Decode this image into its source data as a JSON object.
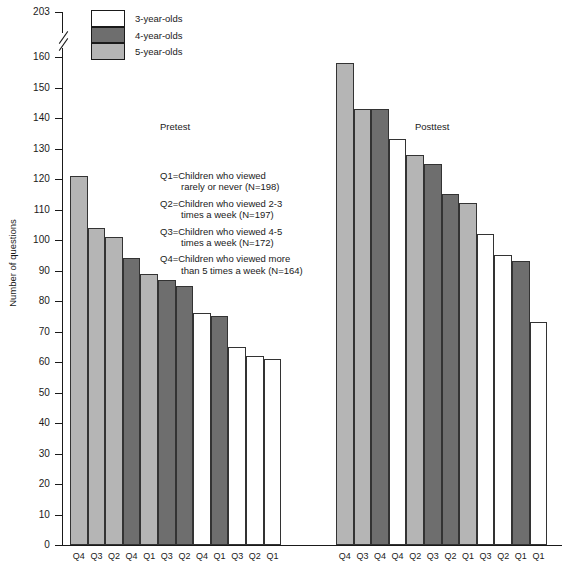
{
  "chart_data": {
    "type": "bar",
    "title": "",
    "xlabel": "",
    "ylabel": "Number of questions",
    "ylim": [
      0,
      203
    ],
    "yticks": [
      0,
      10,
      20,
      30,
      40,
      50,
      60,
      70,
      80,
      90,
      100,
      110,
      120,
      130,
      140,
      150,
      160,
      203
    ],
    "axis_break": {
      "after": 160,
      "before": 203
    },
    "grid": false,
    "legend_position": "top-left",
    "legend": [
      {
        "label": "3-year-olds",
        "color": "#ffffff"
      },
      {
        "label": "4-year-olds",
        "color": "#6e6e6e"
      },
      {
        "label": "5-year-olds",
        "color": "#b5b5b5"
      }
    ],
    "groups": [
      {
        "name": "Pretest",
        "bars": [
          {
            "category": "Q4",
            "series": "5-year-olds",
            "value": 121,
            "color": "#b5b5b5"
          },
          {
            "category": "Q3",
            "series": "5-year-olds",
            "value": 104,
            "color": "#b5b5b5"
          },
          {
            "category": "Q2",
            "series": "5-year-olds",
            "value": 101,
            "color": "#b5b5b5"
          },
          {
            "category": "Q4",
            "series": "4-year-olds",
            "value": 94,
            "color": "#6e6e6e"
          },
          {
            "category": "Q1",
            "series": "5-year-olds",
            "value": 89,
            "color": "#b5b5b5"
          },
          {
            "category": "Q3",
            "series": "4-year-olds",
            "value": 87,
            "color": "#6e6e6e"
          },
          {
            "category": "Q2",
            "series": "4-year-olds",
            "value": 85,
            "color": "#6e6e6e"
          },
          {
            "category": "Q4",
            "series": "3-year-olds",
            "value": 76,
            "color": "#ffffff"
          },
          {
            "category": "Q1",
            "series": "4-year-olds",
            "value": 75,
            "color": "#6e6e6e"
          },
          {
            "category": "Q3",
            "series": "3-year-olds",
            "value": 65,
            "color": "#ffffff"
          },
          {
            "category": "Q2",
            "series": "3-year-olds",
            "value": 62,
            "color": "#ffffff"
          },
          {
            "category": "Q1",
            "series": "3-year-olds",
            "value": 61,
            "color": "#ffffff"
          }
        ]
      },
      {
        "name": "Posttest",
        "bars": [
          {
            "category": "Q4",
            "series": "5-year-olds",
            "value": 158,
            "color": "#b5b5b5"
          },
          {
            "category": "Q3",
            "series": "5-year-olds",
            "value": 143,
            "color": "#b5b5b5"
          },
          {
            "category": "Q4",
            "series": "4-year-olds",
            "value": 143,
            "color": "#6e6e6e"
          },
          {
            "category": "Q4",
            "series": "3-year-olds",
            "value": 133,
            "color": "#ffffff"
          },
          {
            "category": "Q2",
            "series": "5-year-olds",
            "value": 128,
            "color": "#b5b5b5"
          },
          {
            "category": "Q3",
            "series": "4-year-olds",
            "value": 125,
            "color": "#6e6e6e"
          },
          {
            "category": "Q2",
            "series": "4-year-olds",
            "value": 115,
            "color": "#6e6e6e"
          },
          {
            "category": "Q1",
            "series": "5-year-olds",
            "value": 112,
            "color": "#b5b5b5"
          },
          {
            "category": "Q3",
            "series": "3-year-olds",
            "value": 102,
            "color": "#ffffff"
          },
          {
            "category": "Q2",
            "series": "3-year-olds",
            "value": 95,
            "color": "#ffffff"
          },
          {
            "category": "Q1",
            "series": "4-year-olds",
            "value": 93,
            "color": "#6e6e6e"
          },
          {
            "category": "Q1",
            "series": "3-year-olds",
            "value": 73,
            "color": "#ffffff"
          }
        ]
      }
    ],
    "annotations": [
      {
        "id": "q1",
        "line1": "Q1=Children who viewed",
        "line2": "rarely or never (N=198)"
      },
      {
        "id": "q2",
        "line1": "Q2=Children who viewed 2-3",
        "line2": "times a week  (N=197)"
      },
      {
        "id": "q3",
        "line1": "Q3=Children who viewed 4-5",
        "line2": "times a week  (N=172)"
      },
      {
        "id": "q4",
        "line1": "Q4=Children who viewed more",
        "line2": "than 5 times a week  (N=164)"
      }
    ]
  },
  "colors": {
    "axis": "#1a1a1a",
    "bar_outline": "#333333",
    "three_year_olds": "#ffffff",
    "four_year_olds": "#6e6e6e",
    "five_year_olds": "#b5b5b5",
    "background": "#ffffff"
  }
}
